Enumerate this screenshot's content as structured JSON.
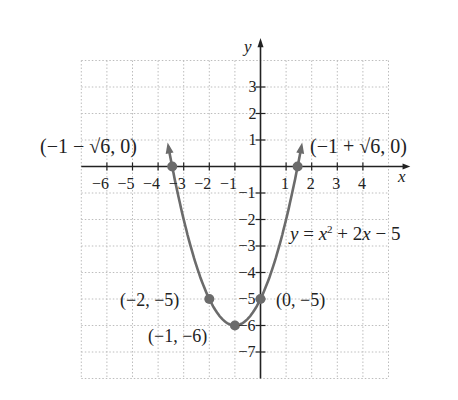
{
  "chart_data": {
    "type": "line",
    "title": "",
    "equation": "y = x^2 + 2x − 5",
    "xlabel": "x",
    "ylabel": "y",
    "xlim": [
      -7,
      5
    ],
    "ylim": [
      -8,
      4
    ],
    "grid": true,
    "x_ticks": [
      -6,
      -5,
      -4,
      -3,
      -2,
      -1,
      1,
      2,
      3,
      4
    ],
    "y_ticks": [
      3,
      2,
      1,
      -1,
      -2,
      -3,
      -4,
      -5,
      -6,
      -7
    ],
    "x_tick_labels": [
      "−6",
      "−5",
      "−4",
      "−3",
      "−2",
      "−1",
      "1",
      "2",
      "3",
      "4"
    ],
    "y_tick_labels": [
      "3",
      "2",
      "1",
      "−1",
      "−2",
      "−3",
      "−4",
      "−5",
      "−6",
      "−7"
    ],
    "series": [
      {
        "name": "y = x^2 + 2x − 5",
        "function": "x^2 + 2x - 5",
        "x_range": [
          -3.6,
          1.6
        ],
        "color": "#6b6b6b"
      }
    ],
    "points": [
      {
        "label": "(−1 − √6, 0)",
        "x": -3.449,
        "y": 0
      },
      {
        "label": "(−1 + √6, 0)",
        "x": 1.449,
        "y": 0
      },
      {
        "label": "(−2, −5)",
        "x": -2,
        "y": -5
      },
      {
        "label": "(0, −5)",
        "x": 0,
        "y": -5
      },
      {
        "label": "(−1, −6)",
        "x": -1,
        "y": -6
      }
    ]
  },
  "labels": {
    "left_root": "(−1 − √6, 0)",
    "right_root": "(−1 + √6, 0)",
    "point_m2": "(−2, −5)",
    "point_0": "(0, −5)",
    "vertex": "(−1, −6)",
    "eq_y": "y",
    "eq_eq": " = ",
    "eq_x": "x",
    "eq_sup": "2",
    "eq_rest": " + 2",
    "eq_x2": "x",
    "eq_tail": " − 5",
    "axis_x": "x",
    "axis_y": "y"
  }
}
